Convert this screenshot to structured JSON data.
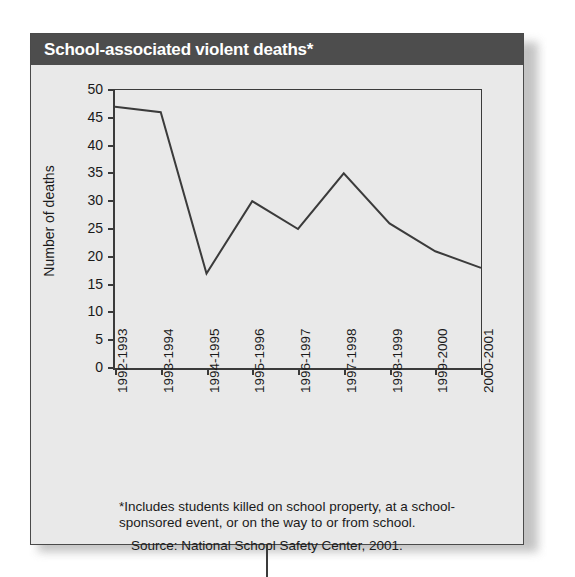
{
  "card": {
    "title": "School-associated violent deaths*",
    "header_color": "#4d4d4d",
    "body_color": "#e9e9e9",
    "border_color": "#4a4a4a"
  },
  "notes": {
    "footnote": "*Includes students killed on school property, at a school-sponsored event, or on the way to or from school.",
    "source": "Source: National School Safety Center, 2001."
  },
  "chart_data": {
    "type": "line",
    "title": "School-associated violent deaths*",
    "xlabel": "",
    "ylabel": "Number of deaths",
    "categories": [
      "1992-1993",
      "1993-1994",
      "1994-1995",
      "1995-1996",
      "1996-1997",
      "1997-1998",
      "1998-1999",
      "1999-2000",
      "2000-2001"
    ],
    "values": [
      47,
      46,
      17,
      30,
      25,
      35,
      26,
      21,
      18
    ],
    "ylim": [
      0,
      50
    ],
    "yticks": [
      0,
      5,
      10,
      15,
      20,
      25,
      30,
      35,
      40,
      45,
      50
    ],
    "ytick_labels": [
      "0",
      "5",
      "10",
      "15",
      "20",
      "25",
      "30",
      "35",
      "40",
      "45",
      "50"
    ],
    "grid": false,
    "legend": false,
    "line_color": "#3b3b3b",
    "line_width": 2,
    "markers": false
  }
}
